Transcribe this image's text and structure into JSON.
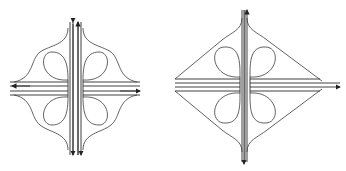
{
  "figure": {
    "panels": [
      {
        "name": "cloverleaf-with-curved-collector-roads",
        "position": "left"
      },
      {
        "name": "cloverleaf-with-diagonal-ramps",
        "position": "right"
      }
    ],
    "colors": {
      "line": "#2a2a2a",
      "background": "#ffffff"
    }
  }
}
